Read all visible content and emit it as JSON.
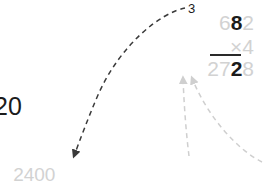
{
  "document": {
    "type": "long-multiplication-worksheet",
    "colors": {
      "ink_dark": "#1b1b1b",
      "ink_faint": "#d2d2d2",
      "arrow_dark": "#3a3a3a",
      "arrow_faint": "#cfcfcf",
      "background": "#ffffff"
    }
  },
  "multiplication": {
    "carry": "3",
    "multiplicand": {
      "full": "682",
      "digits": [
        {
          "char": "6",
          "emphasis": "faint"
        },
        {
          "char": "8",
          "emphasis": "dark"
        },
        {
          "char": "2",
          "emphasis": "faint"
        }
      ]
    },
    "multiplier": {
      "full": "×4",
      "digits": [
        {
          "char": "×",
          "emphasis": "faint"
        },
        {
          "char": "4",
          "emphasis": "faint"
        }
      ]
    },
    "product": {
      "full": "2728",
      "digits": [
        {
          "char": "2",
          "emphasis": "faint"
        },
        {
          "char": "7",
          "emphasis": "faint"
        },
        {
          "char": "2",
          "emphasis": "dark"
        },
        {
          "char": "8",
          "emphasis": "faint"
        }
      ]
    }
  },
  "left_clipped_number": {
    "visible_text": "20",
    "emphasis": "dark"
  },
  "working_lines": {
    "partial": {
      "segments": [
        {
          "text": "2400",
          "emphasis": "faint"
        }
      ]
    },
    "equation": {
      "segments": [
        {
          "text": "2400",
          "emphasis": "faint"
        },
        {
          "text": " + ",
          "emphasis": "faint"
        },
        {
          "text": "300",
          "emphasis": "dark"
        },
        {
          "text": " = ",
          "emphasis": "faint"
        },
        {
          "text": "2700",
          "emphasis": "faint"
        },
        {
          "text": " = ",
          "emphasis": "faint"
        },
        {
          "text": "2000",
          "emphasis": "faint"
        },
        {
          "text": " + ",
          "emphasis": "faint"
        },
        {
          "text": "700",
          "emphasis": "faint"
        }
      ]
    }
  },
  "annotations": {
    "arrows": [
      {
        "name": "carry-to-three-hundred",
        "style": "dashed-dark",
        "from": "carry digit 3",
        "to": "300"
      },
      {
        "name": "two-thousand-to-product-digit",
        "style": "dashed-faint",
        "from": "2000",
        "to": "product digit 2"
      },
      {
        "name": "seven-hundred-to-product-digit",
        "style": "dashed-faint",
        "from": "700",
        "to": "product digit 7"
      }
    ]
  }
}
